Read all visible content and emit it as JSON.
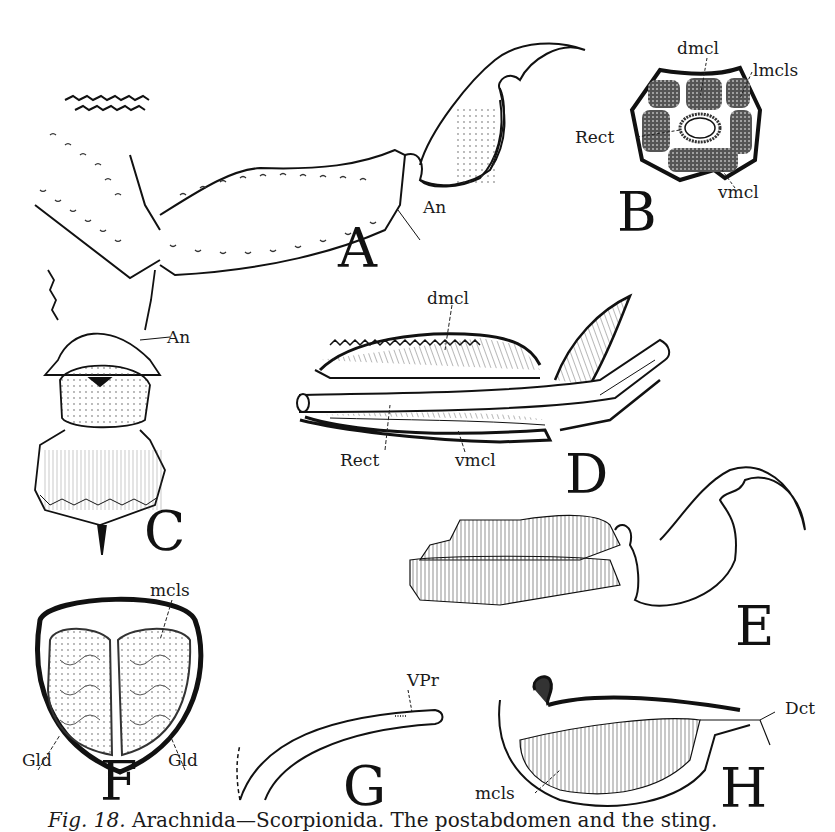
{
  "figure": {
    "panels": [
      {
        "id": "A",
        "letter": "A",
        "labels": [
          "An"
        ]
      },
      {
        "id": "B",
        "letter": "B",
        "labels": [
          "dmcl",
          "lmcls",
          "Rect",
          "vmcl"
        ]
      },
      {
        "id": "C",
        "letter": "C",
        "labels": [
          "An"
        ]
      },
      {
        "id": "D",
        "letter": "D",
        "labels": [
          "dmcl",
          "Rect",
          "vmcl"
        ]
      },
      {
        "id": "E",
        "letter": "E",
        "labels": []
      },
      {
        "id": "F",
        "letter": "F",
        "labels": [
          "mcls",
          "Gld",
          "Gld"
        ]
      },
      {
        "id": "G",
        "letter": "G",
        "labels": [
          "VPr"
        ]
      },
      {
        "id": "H",
        "letter": "H",
        "labels": [
          "Dct",
          "mcls"
        ]
      }
    ],
    "caption": {
      "fig_label": "Fig. 18.",
      "text": "Arachnida—Scorpionida. The postabdomen and the sting."
    }
  }
}
